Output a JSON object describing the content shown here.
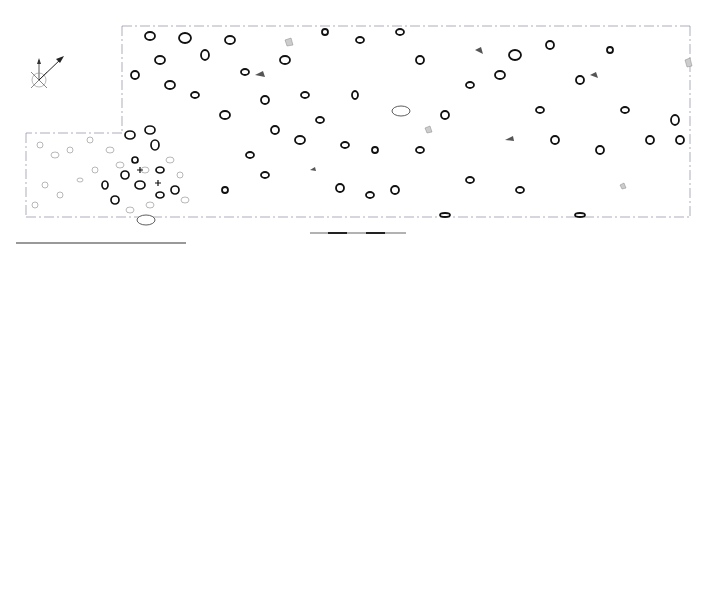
{
  "figure": {
    "panels": [
      {
        "id": "a",
        "letter": "a",
        "north_arrow": {
          "site_label": "site",
          "site_n": "N",
          "true_label": "true",
          "true_n": "N"
        },
        "grid_labels": {
          "top_left_y": "14",
          "top_left_x": "54",
          "top_right_y": "14",
          "top_right_x": "60",
          "bottom_left_y": "12",
          "bottom_left_x": "53",
          "bottom_right_y": "12",
          "bottom_right_x": "60"
        },
        "features": [
          {
            "label": "822"
          },
          {
            "label": "823"
          }
        ],
        "scale": {
          "start": "0",
          "end": "1m."
        },
        "key": {
          "title": "Key",
          "items": [
            {
              "icon": "pot-icon",
              "label": "pot"
            },
            {
              "icon": "bone-icon",
              "label": "bone"
            },
            {
              "icon": "burnt-flint-icon",
              "label": "burnt flint"
            },
            {
              "icon": "fired-clay-icon",
              "label": "fired clay"
            },
            {
              "icon": "pebbles-icon",
              "label": "pebbles"
            },
            {
              "icon": "struck-flint-icon",
              "label": "struck flint"
            },
            {
              "icon": "feature-layer-icon",
              "badge": "956",
              "label": "feature / layer No"
            }
          ]
        }
      },
      {
        "id": "b",
        "letter": "b",
        "north_arrow": {
          "site_label": "site",
          "site_n": "N",
          "true_label": "true",
          "true_n": "N"
        },
        "grid_labels": {
          "top_left_y": "14",
          "top_left_x": "54",
          "top_right_y": "14",
          "top_right_x": "60",
          "bottom_left_y": "12",
          "bottom_left_x": "53",
          "bottom_right_y": "12",
          "bottom_right_x": "60"
        },
        "contours": [
          {
            "label": "14.50"
          },
          {
            "label": "14.48"
          },
          {
            "label": "14.46"
          },
          {
            "label": "14.44"
          },
          {
            "label": "14.42"
          },
          {
            "label": "14.52"
          }
        ],
        "scale": {
          "start": "0",
          "end": "1m."
        },
        "key": {
          "title": "Key",
          "sample_value": "14.28",
          "unit": "m. OD"
        }
      }
    ]
  }
}
